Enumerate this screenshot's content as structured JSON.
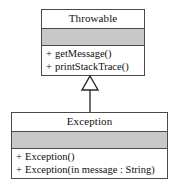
{
  "diagram": {
    "kind": "uml-class-diagram",
    "background_color": "#ffffff",
    "line_color": "#4a4a4a",
    "attribute_fill_color": "#c8c8c8",
    "text_color": "#101010"
  },
  "classes": [
    {
      "id": "throwable",
      "name": "Throwable",
      "attributes": [],
      "operations": [
        {
          "visibility": "+",
          "signature": "getMessage()"
        },
        {
          "visibility": "+",
          "signature": "printStackTrace()"
        }
      ]
    },
    {
      "id": "exception",
      "name": "Exception",
      "attributes": [],
      "operations": [
        {
          "visibility": "+",
          "signature": "Exception()"
        },
        {
          "visibility": "+",
          "signature": "Exception(in message : String)"
        }
      ]
    }
  ],
  "relationships": [
    {
      "type": "generalization",
      "label": "",
      "from": "Exception",
      "to": "Throwable",
      "arrow_head": "hollow-triangle"
    }
  ]
}
